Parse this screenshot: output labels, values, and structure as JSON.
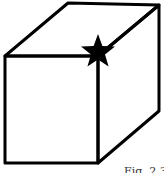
{
  "figure": {
    "type": "isometric cube drawing",
    "caption": "Fig. 2.3",
    "stroke_color": "#000000",
    "background": "#ffffff",
    "marker": {
      "shape": "five-pointed star",
      "position": "front top-right corner (shared with back edge)",
      "color": "#000000"
    }
  }
}
